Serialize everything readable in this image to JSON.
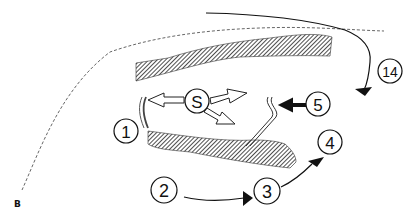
{
  "panel_letter": "B",
  "labels": {
    "s": "S",
    "n1": "1",
    "n2": "2",
    "n3": "3",
    "n4": "4",
    "n5": "5",
    "n14": "14"
  },
  "colors": {
    "stroke": "#111111",
    "hatch": "#333333",
    "background": "#ffffff",
    "dashed": "#555555"
  }
}
